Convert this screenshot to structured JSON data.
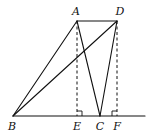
{
  "diagram": {
    "type": "geometry",
    "points": {
      "A": {
        "label": "A",
        "x": 77,
        "y": 21
      },
      "D": {
        "label": "D",
        "x": 117,
        "y": 21
      },
      "B": {
        "label": "B",
        "x": 13,
        "y": 116
      },
      "E": {
        "label": "E",
        "x": 77,
        "y": 116
      },
      "C": {
        "label": "C",
        "x": 100,
        "y": 116
      },
      "F": {
        "label": "F",
        "x": 117,
        "y": 116
      }
    },
    "solid_segments": [
      "AD",
      "AB",
      "AC",
      "BD",
      "DC",
      "BF-line"
    ],
    "dashed_segments": [
      "AE",
      "DF"
    ],
    "right_angles": [
      "AEB",
      "DFC"
    ],
    "labels": {
      "A": "A",
      "D": "D",
      "B": "B",
      "E": "E",
      "C": "C",
      "F": "F"
    },
    "colors": {
      "stroke": "#111111",
      "background": "#ffffff"
    }
  }
}
